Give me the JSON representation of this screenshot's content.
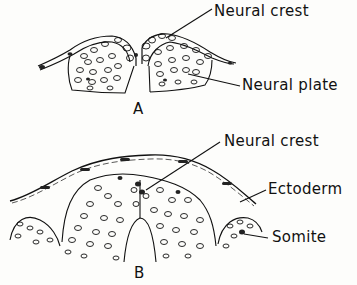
{
  "figure": {
    "panel_a": {
      "letter": "A",
      "labels": {
        "neural_crest": "Neural crest",
        "neural_plate": "Neural plate"
      }
    },
    "panel_b": {
      "letter": "B",
      "labels": {
        "neural_crest": "Neural crest",
        "ectoderm": "Ectoderm",
        "somite": "Somite"
      }
    }
  }
}
